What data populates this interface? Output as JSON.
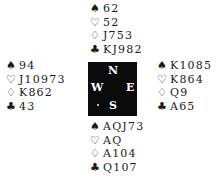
{
  "hands": {
    "north": {
      "spades": "62",
      "hearts": "52",
      "diamonds": "J753",
      "clubs": "KJ982"
    },
    "west": {
      "spades": "94",
      "hearts": "J10973",
      "diamonds": "K862",
      "clubs": "43"
    },
    "east": {
      "spades": "K1085",
      "hearts": "K864",
      "diamonds": "Q9",
      "clubs": "A65"
    },
    "south": {
      "spades": "AQJ73",
      "hearts": "AQ",
      "diamonds": "A104",
      "clubs": "Q107"
    }
  },
  "suits": {
    "spades": "♠",
    "hearts": "♡",
    "diamonds": "♢",
    "clubs": "♣"
  },
  "compass": {
    "north": "N",
    "west": "W",
    "east": "E",
    "south": "S"
  },
  "colors": {
    "compass_bg": "#0a0a0a",
    "compass_text": "#ffffff",
    "text": "#1a1a1a"
  }
}
